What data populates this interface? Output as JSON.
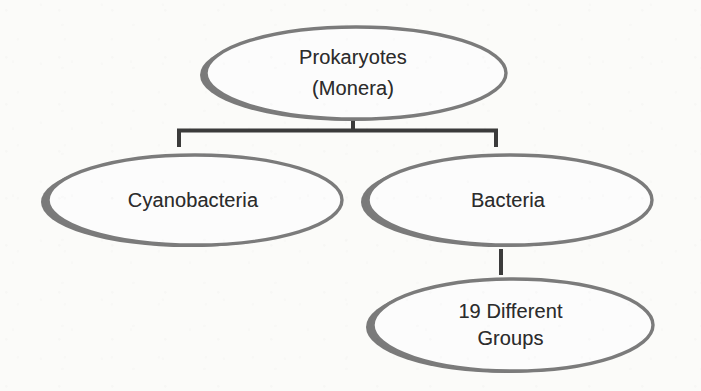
{
  "diagram": {
    "type": "hierarchy-tree",
    "background_color": "#fbfbf9",
    "node_outline_color": "#7b7b7b",
    "node_shadow_color": "#6f6f6f",
    "node_fill_color": "#fcfcfc",
    "connector_color": "#3b3b3b",
    "text_color": "#2c2c2c",
    "nodes": [
      {
        "id": "prokaryotes",
        "label": "Prokaryotes\n(Monera)",
        "line1": "Prokaryotes",
        "line2": "(Monera)",
        "level": 0
      },
      {
        "id": "cyanobacteria",
        "label": "Cyanobacteria",
        "level": 1
      },
      {
        "id": "bacteria",
        "label": "Bacteria",
        "level": 1
      },
      {
        "id": "groups",
        "label": "19 Different\nGroups",
        "line1": "19 Different",
        "line2": "Groups",
        "level": 2
      }
    ],
    "edges": [
      {
        "id": "edge-prokaryotes-cyanobacteria",
        "from": "prokaryotes",
        "to": "cyanobacteria",
        "style": "elbow-bracket"
      },
      {
        "id": "edge-prokaryotes-bacteria",
        "from": "prokaryotes",
        "to": "bacteria",
        "style": "elbow-bracket"
      },
      {
        "id": "edge-bacteria-groups",
        "from": "bacteria",
        "to": "groups",
        "style": "straight-vertical"
      }
    ]
  }
}
